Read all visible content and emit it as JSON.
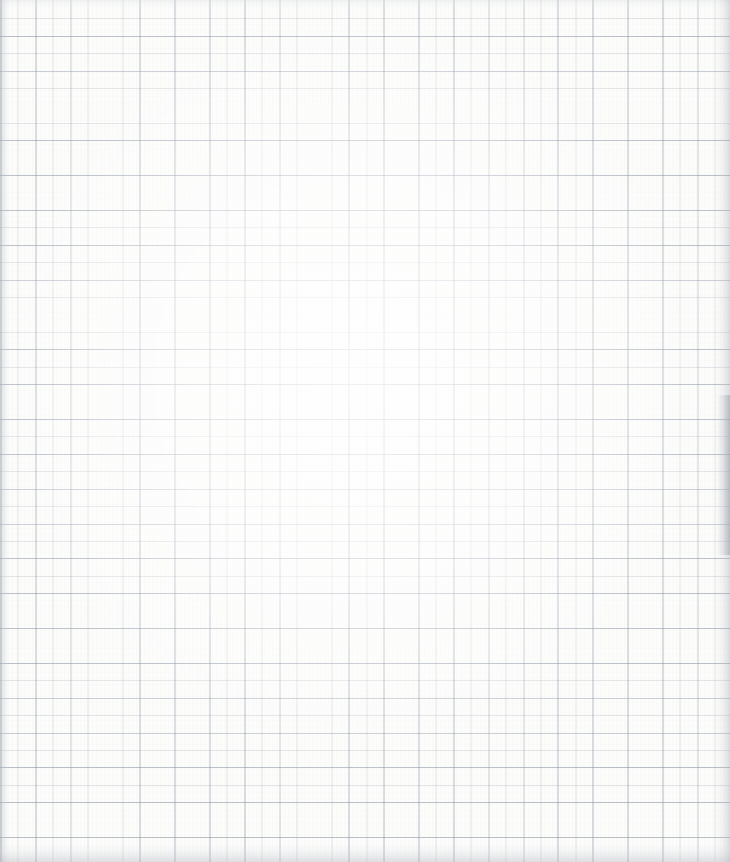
{
  "document": {
    "kind": "scanned-graph-paper",
    "content_text": "",
    "has_writing": false,
    "has_printed_text": false,
    "annotation": "Blank sheet of squared / graph paper, no markings"
  },
  "canvas": {
    "width": 730,
    "height": 862
  },
  "grid": {
    "minor_pitch_px": 17.42,
    "major_pitch_px": 34.84,
    "minor_line_color": "#969eaa",
    "major_line_color": "#808a9b",
    "line_width_px": 0.7,
    "orientation": "square",
    "columns_visible": 42,
    "rows_visible": 50
  },
  "paper": {
    "base_color": "#fcfcfb",
    "highlight_color": "#ffffff",
    "grain_color": "#acb0b8"
  },
  "scan_artifacts": {
    "left_edge_shadow_color": "#b2b6be",
    "right_edge_shadow_color": "#a8acb4",
    "right_hotspot_shadow_color": "#969ba4",
    "bottom_edge_shadow_color": "#b0b4bc",
    "top_edge_shadow_color": "#d6d9de",
    "vignette_center_x_pct": 48,
    "vignette_center_y_pct": 44
  }
}
